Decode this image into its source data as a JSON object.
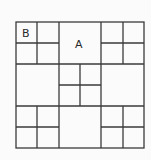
{
  "diagram": {
    "type": "square-grid-puzzle",
    "grid": {
      "left": 16,
      "top": 22,
      "size": 128,
      "divisions": 6
    },
    "blocks": [
      {
        "row": 0,
        "col": 0,
        "subdivided": true
      },
      {
        "row": 0,
        "col": 1,
        "subdivided": false
      },
      {
        "row": 0,
        "col": 2,
        "subdivided": true
      },
      {
        "row": 1,
        "col": 0,
        "subdivided": false
      },
      {
        "row": 1,
        "col": 1,
        "subdivided": true
      },
      {
        "row": 1,
        "col": 2,
        "subdivided": false
      },
      {
        "row": 2,
        "col": 0,
        "subdivided": true
      },
      {
        "row": 2,
        "col": 1,
        "subdivided": false
      },
      {
        "row": 2,
        "col": 2,
        "subdivided": true
      }
    ],
    "labels": {
      "b": "B",
      "a": "A"
    }
  }
}
